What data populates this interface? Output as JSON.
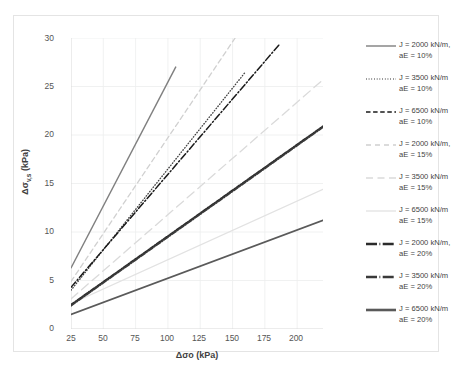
{
  "chart_data": {
    "type": "line",
    "title": "",
    "xlabel": "Δσo (kPa)",
    "ylabel": "Δσv,s (kPa)",
    "xlim": [
      25,
      220
    ],
    "ylim": [
      0,
      30
    ],
    "xticks": [
      25,
      50,
      75,
      100,
      125,
      150,
      175,
      200
    ],
    "yticks": [
      0,
      5,
      10,
      15,
      20,
      25,
      30
    ],
    "grid": true,
    "legend_position": "right",
    "series": [
      {
        "name": "J = 2000 kN/m, aE = 10%",
        "J": 2000,
        "aE": "10%",
        "style": "solid",
        "color": "#7f7f7f",
        "width": 1.4,
        "x": [
          25,
          106
        ],
        "y": [
          6.3,
          27.0
        ]
      },
      {
        "name": "J = 3500 kN/m aE = 10%",
        "J": 3500,
        "aE": "10%",
        "style": "dotted",
        "color": "#3f3f3f",
        "width": 1.3,
        "x": [
          25,
          160
        ],
        "y": [
          4.0,
          26.5
        ]
      },
      {
        "name": "J = 6500 kN/m aE = 10%",
        "J": 6500,
        "aE": "10%",
        "style": "dashdot",
        "color": "#1a1a1a",
        "width": 1.5,
        "x": [
          25,
          186
        ],
        "y": [
          4.3,
          29.3
        ]
      },
      {
        "name": "J = 2000 kN/m, aE = 15%",
        "J": 2000,
        "aE": "15%",
        "style": "dashed",
        "color": "#d0d0d0",
        "width": 1.3,
        "x": [
          25,
          152
        ],
        "y": [
          4.9,
          30.0
        ]
      },
      {
        "name": "J = 3500 kN/m aE = 15%",
        "J": 3500,
        "aE": "15%",
        "style": "dashed-long",
        "color": "#dadada",
        "width": 1.3,
        "x": [
          25,
          220
        ],
        "y": [
          3.1,
          25.7
        ]
      },
      {
        "name": "J = 6500 kN/m aE = 15%",
        "J": 6500,
        "aE": "15%",
        "style": "solid-light",
        "color": "#e2e2e2",
        "width": 1.3,
        "x": [
          25,
          220
        ],
        "y": [
          2.6,
          14.4
        ]
      },
      {
        "name": "J = 2000 kN/m, aE = 20%",
        "J": 2000,
        "aE": "20%",
        "style": "solid-bold",
        "color": "#2b2b2b",
        "width": 1.9,
        "x": [
          25,
          220
        ],
        "y": [
          2.5,
          20.9
        ]
      },
      {
        "name": "J = 3500 kN/m aE = 20%",
        "J": 3500,
        "aE": "20%",
        "style": "dashdot-bold",
        "color": "#3a3a3a",
        "width": 1.8,
        "x": [
          25,
          220
        ],
        "y": [
          2.4,
          20.8
        ]
      },
      {
        "name": "J = 6500 kN/m aE = 20%",
        "J": 6500,
        "aE": "20%",
        "style": "solid-dark",
        "color": "#5a5a5a",
        "width": 1.8,
        "x": [
          25,
          220
        ],
        "y": [
          1.5,
          11.2
        ]
      }
    ]
  },
  "axes": {
    "x_title": "Δσo (kPa)",
    "y_title_main": "Δσ",
    "y_title_sub": "v,s",
    "y_title_tail": " (kPa)",
    "xticks": [
      "25",
      "50",
      "75",
      "100",
      "125",
      "150",
      "175",
      "200"
    ],
    "yticks": [
      "30",
      "25",
      "20",
      "15",
      "10",
      "5",
      "0"
    ]
  },
  "legend": {
    "items": [
      {
        "line1": "J = 2000 kN/m,",
        "line2": "aE = 10%",
        "style": "solid",
        "color": "#7f7f7f",
        "width": 1.4
      },
      {
        "line1": "J = 3500 kN/m",
        "line2": "aE = 10%",
        "style": "dotted",
        "color": "#3f3f3f",
        "width": 1.3
      },
      {
        "line1": "J = 6500 kN/m",
        "line2": "aE = 10%",
        "style": "dashed",
        "color": "#1a1a1a",
        "width": 1.5
      },
      {
        "line1": "J = 2000 kN/m,",
        "line2": "aE = 15%",
        "style": "dashed-lite",
        "color": "#d0d0d0",
        "width": 1.3
      },
      {
        "line1": "J = 3500 kN/m",
        "line2": "aE = 15%",
        "style": "dashed-lite2",
        "color": "#dadada",
        "width": 1.3
      },
      {
        "line1": "J = 6500 kN/m",
        "line2": "aE = 15%",
        "style": "solid-lite",
        "color": "#e2e2e2",
        "width": 1.3
      },
      {
        "line1": "J = 2000 kN/m,",
        "line2": "aE = 20%",
        "style": "bold-dot",
        "color": "#2b2b2b",
        "width": 2.6
      },
      {
        "line1": "J = 3500 kN/m",
        "line2": "aE = 20%",
        "style": "bold-dot2",
        "color": "#3a3a3a",
        "width": 2.6
      },
      {
        "line1": "J = 6500 kN/m",
        "line2": "aE = 20%",
        "style": "bold-solid",
        "color": "#5a5a5a",
        "width": 2.6
      }
    ]
  },
  "caption": {
    "text": ""
  }
}
